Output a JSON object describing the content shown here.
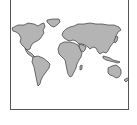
{
  "image": {
    "subject": "world-map-icon",
    "style": "grayscale continents with dark outline inside a thin square frame",
    "colors": {
      "background": "#ffffff",
      "frame": "#555555",
      "land_fill": "#b4b4b4",
      "land_outline": "#3a3a3a"
    },
    "continents": [
      "North America",
      "Greenland",
      "South America",
      "Europe",
      "Africa",
      "Asia",
      "Australia",
      "New Zealand",
      "Japan",
      "Madagascar",
      "Indonesia"
    ]
  }
}
